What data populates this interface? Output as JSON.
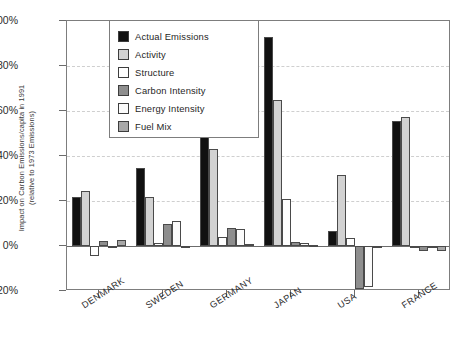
{
  "chart_data": {
    "type": "bar",
    "title": "",
    "xlabel": "",
    "ylabel": "Impact on Carbon Emissions/capita in 1991\n(relative to 1973 Emissions)",
    "ylim": [
      -20,
      100
    ],
    "ytick_labels": [
      "100%",
      "80%",
      "60%",
      "40%",
      "20%",
      "0%",
      "-20%"
    ],
    "ytick_values": [
      100,
      80,
      60,
      40,
      20,
      0,
      -20
    ],
    "grid": true,
    "legend_position": "top-left-inside",
    "categories": [
      "DENMARK",
      "SWEDEN",
      "GERMANY",
      "JAPAN",
      "USA",
      "FRANCE"
    ],
    "series": [
      {
        "name": "Actual Emissions",
        "color": "#111111",
        "values": [
          22.0,
          34.5,
          60.5,
          93.0,
          6.5,
          55.5
        ]
      },
      {
        "name": "Activity",
        "color": "#d2d2d2",
        "values": [
          24.5,
          22.0,
          43.0,
          65.0,
          31.5,
          57.5
        ]
      },
      {
        "name": "Structure",
        "color": "#ffffff",
        "values": [
          -4.5,
          1.2,
          4.0,
          21.0,
          3.5,
          0.0
        ]
      },
      {
        "name": "Carbon Intensity",
        "color": "#8e8e8e",
        "values": [
          2.3,
          10.0,
          8.0,
          2.0,
          -19.0,
          -2.0
        ]
      },
      {
        "name": "Energy Intensity",
        "color": "#fbfbfb",
        "values": [
          0.2,
          11.0,
          7.5,
          1.5,
          -18.0,
          -0.6
        ]
      },
      {
        "name": "Fuel Mix",
        "color": "#a8a8a8",
        "values": [
          2.5,
          -1.0,
          1.0,
          0.3,
          -0.6,
          -2.0
        ]
      }
    ]
  },
  "legend": {
    "items": [
      {
        "label": "Actual Emissions",
        "swatch": "legend-swatch-actual-emissions"
      },
      {
        "label": "Activity",
        "swatch": "legend-swatch-activity"
      },
      {
        "label": "Structure",
        "swatch": "legend-swatch-structure"
      },
      {
        "label": "Carbon Intensity",
        "swatch": "legend-swatch-carbon-intensity"
      },
      {
        "label": "Energy Intensity",
        "swatch": "legend-swatch-energy-intensity"
      },
      {
        "label": "Fuel Mix",
        "swatch": "legend-swatch-fuel-mix"
      }
    ]
  }
}
